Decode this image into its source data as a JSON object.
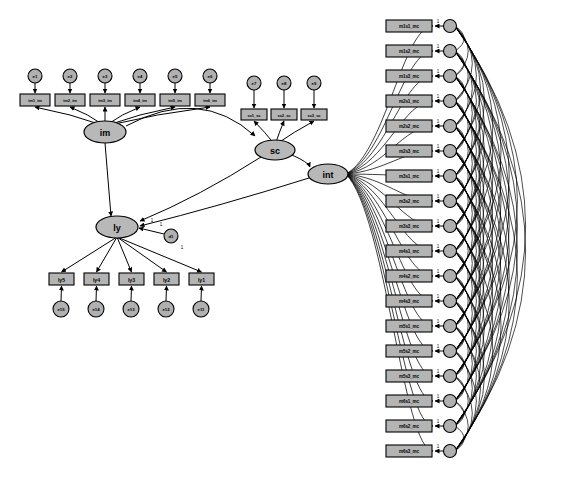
{
  "diagram": {
    "type": "sem-path-diagram",
    "width": 567,
    "height": 481,
    "background_color": "#ffffff",
    "node_fill_color": "#b4b4b4",
    "node_stroke_color": "#000000",
    "latent_variables": [
      {
        "id": "im",
        "label": "im",
        "cx": 105,
        "cy": 132,
        "rx": 21,
        "ry": 11
      },
      {
        "id": "ly",
        "label": "ly",
        "cx": 117,
        "cy": 227,
        "rx": 21,
        "ry": 11
      },
      {
        "id": "sc",
        "label": "sc",
        "cx": 275,
        "cy": 150,
        "rx": 20,
        "ry": 10
      },
      {
        "id": "int",
        "label": "int",
        "cx": 328,
        "cy": 174,
        "rx": 20,
        "ry": 10
      }
    ],
    "im_indicators": [
      {
        "id": "im1",
        "label": "im1_im",
        "x": 20,
        "y": 94,
        "w": 30,
        "h": 12
      },
      {
        "id": "im2",
        "label": "im2_im",
        "x": 55,
        "y": 94,
        "w": 30,
        "h": 12
      },
      {
        "id": "im3",
        "label": "im3_im",
        "x": 90,
        "y": 94,
        "w": 30,
        "h": 12
      },
      {
        "id": "im4",
        "label": "im4_im",
        "x": 125,
        "y": 94,
        "w": 30,
        "h": 12
      },
      {
        "id": "im5",
        "label": "im5_im",
        "x": 160,
        "y": 94,
        "w": 30,
        "h": 12
      },
      {
        "id": "im6",
        "label": "im6_im",
        "x": 195,
        "y": 94,
        "w": 30,
        "h": 12
      }
    ],
    "im_errors": [
      {
        "id": "e1",
        "label": "e1",
        "cx": 35,
        "cy": 76,
        "r": 7
      },
      {
        "id": "e2",
        "label": "e2",
        "cx": 70,
        "cy": 76,
        "r": 7
      },
      {
        "id": "e3",
        "label": "e3",
        "cx": 105,
        "cy": 76,
        "r": 7
      },
      {
        "id": "e4",
        "label": "e4",
        "cx": 140,
        "cy": 76,
        "r": 7
      },
      {
        "id": "e5",
        "label": "e5",
        "cx": 175,
        "cy": 76,
        "r": 7
      },
      {
        "id": "e6",
        "label": "e6",
        "cx": 210,
        "cy": 76,
        "r": 7
      }
    ],
    "sc_indicators": [
      {
        "id": "sc1",
        "label": "sc1_sc",
        "x": 241,
        "y": 109,
        "w": 26,
        "h": 11
      },
      {
        "id": "sc2",
        "label": "sc2_sc",
        "x": 271,
        "y": 109,
        "w": 26,
        "h": 11
      },
      {
        "id": "sc3",
        "label": "sc3_sc",
        "x": 301,
        "y": 109,
        "w": 26,
        "h": 11
      }
    ],
    "sc_errors": [
      {
        "id": "e7",
        "label": "e7",
        "cx": 254,
        "cy": 83,
        "r": 7
      },
      {
        "id": "e8",
        "label": "e8",
        "cx": 284,
        "cy": 83,
        "r": 7
      },
      {
        "id": "e9",
        "label": "e9",
        "cx": 314,
        "cy": 83,
        "r": 7
      }
    ],
    "ly_indicators": [
      {
        "id": "ly5",
        "label": "ly5",
        "x": 49,
        "y": 273,
        "w": 25,
        "h": 12
      },
      {
        "id": "ly4",
        "label": "ly4",
        "x": 84,
        "y": 273,
        "w": 25,
        "h": 12
      },
      {
        "id": "ly3",
        "label": "ly3",
        "x": 119,
        "y": 273,
        "w": 25,
        "h": 12
      },
      {
        "id": "ly2",
        "label": "ly2",
        "x": 154,
        "y": 273,
        "w": 25,
        "h": 12
      },
      {
        "id": "ly1",
        "label": "ly1",
        "x": 189,
        "y": 273,
        "w": 25,
        "h": 12
      }
    ],
    "ly_errors": [
      {
        "id": "e15",
        "label": "e15",
        "cx": 61,
        "cy": 309,
        "r": 8
      },
      {
        "id": "e14",
        "label": "e14",
        "cx": 96,
        "cy": 309,
        "r": 8
      },
      {
        "id": "e13",
        "label": "e13",
        "cx": 131,
        "cy": 309,
        "r": 8
      },
      {
        "id": "e12",
        "label": "e12",
        "cx": 166,
        "cy": 309,
        "r": 8
      },
      {
        "id": "e11",
        "label": "e11",
        "cx": 201,
        "cy": 309,
        "r": 8
      }
    ],
    "disturbances": [
      {
        "id": "d1",
        "label": "d1",
        "cx": 171,
        "cy": 236,
        "r": 7
      }
    ],
    "interaction_indicators": [
      {
        "id": "m1s1",
        "label": "m1s1_mc",
        "x": 386,
        "y": 20,
        "w": 46,
        "h": 12,
        "err_cx": 450,
        "err_cy": 26,
        "err_label": "r1"
      },
      {
        "id": "m1s2",
        "label": "m1s2_mc",
        "x": 386,
        "y": 45,
        "w": 46,
        "h": 12,
        "err_cx": 450,
        "err_cy": 51,
        "err_label": "r2"
      },
      {
        "id": "m1s3",
        "label": "m1s3_mc",
        "x": 386,
        "y": 70,
        "w": 46,
        "h": 12,
        "err_cx": 450,
        "err_cy": 76,
        "err_label": "r3"
      },
      {
        "id": "m2s1",
        "label": "m2s1_mc",
        "x": 386,
        "y": 95,
        "w": 46,
        "h": 12,
        "err_cx": 450,
        "err_cy": 101,
        "err_label": "r4"
      },
      {
        "id": "m2s2",
        "label": "m2s2_mc",
        "x": 386,
        "y": 120,
        "w": 46,
        "h": 12,
        "err_cx": 450,
        "err_cy": 126,
        "err_label": "r5"
      },
      {
        "id": "m2s3",
        "label": "m2s3_mc",
        "x": 386,
        "y": 145,
        "w": 46,
        "h": 12,
        "err_cx": 450,
        "err_cy": 151,
        "err_label": "r6"
      },
      {
        "id": "m3s1",
        "label": "m3s1_mc",
        "x": 386,
        "y": 170,
        "w": 46,
        "h": 12,
        "err_cx": 450,
        "err_cy": 176,
        "err_label": "r7"
      },
      {
        "id": "m3s2",
        "label": "m3s2_mc",
        "x": 386,
        "y": 195,
        "w": 46,
        "h": 12,
        "err_cx": 450,
        "err_cy": 201,
        "err_label": "r8"
      },
      {
        "id": "m3s3",
        "label": "m3s3_mc",
        "x": 386,
        "y": 220,
        "w": 46,
        "h": 12,
        "err_cx": 450,
        "err_cy": 226,
        "err_label": "r9"
      },
      {
        "id": "m4s1",
        "label": "m4s1_mc",
        "x": 386,
        "y": 245,
        "w": 46,
        "h": 12,
        "err_cx": 450,
        "err_cy": 251,
        "err_label": "r10"
      },
      {
        "id": "m4s2",
        "label": "m4s2_mc",
        "x": 386,
        "y": 270,
        "w": 46,
        "h": 12,
        "err_cx": 450,
        "err_cy": 276,
        "err_label": "r11"
      },
      {
        "id": "m4s3",
        "label": "m4s3_mc",
        "x": 386,
        "y": 295,
        "w": 46,
        "h": 12,
        "err_cx": 450,
        "err_cy": 301,
        "err_label": "r12"
      },
      {
        "id": "m5s1",
        "label": "m5s1_mc",
        "x": 386,
        "y": 320,
        "w": 46,
        "h": 12,
        "err_cx": 450,
        "err_cy": 326,
        "err_label": "r13"
      },
      {
        "id": "m5s2",
        "label": "m5s2_mc",
        "x": 386,
        "y": 345,
        "w": 46,
        "h": 12,
        "err_cx": 450,
        "err_cy": 351,
        "err_label": "r14"
      },
      {
        "id": "m5s3",
        "label": "m5s3_mc",
        "x": 386,
        "y": 370,
        "w": 46,
        "h": 12,
        "err_cx": 450,
        "err_cy": 376,
        "err_label": "r15"
      },
      {
        "id": "m6s1",
        "label": "m6s1_mc",
        "x": 386,
        "y": 395,
        "w": 46,
        "h": 12,
        "err_cx": 450,
        "err_cy": 401,
        "err_label": "r16"
      },
      {
        "id": "m6s2",
        "label": "m6s2_mc",
        "x": 386,
        "y": 420,
        "w": 46,
        "h": 12,
        "err_cx": 450,
        "err_cy": 426,
        "err_label": "r17"
      },
      {
        "id": "m6s3",
        "label": "m6s3_mc",
        "x": 386,
        "y": 445,
        "w": 46,
        "h": 12,
        "err_cx": 450,
        "err_cy": 451,
        "err_label": "r18"
      }
    ],
    "path_coefficients": [
      {
        "id": "c1",
        "label": "1",
        "x": 152,
        "y": 222
      },
      {
        "id": "c2",
        "label": "1",
        "x": 182,
        "y": 249
      },
      {
        "id": "c3",
        "label": "1",
        "x": 161,
        "y": 226
      }
    ],
    "structural_paths": [
      {
        "from": "im",
        "to": "ly"
      },
      {
        "from": "im",
        "to": "sc"
      },
      {
        "from": "sc",
        "to": "ly"
      },
      {
        "from": "int",
        "to": "ly"
      },
      {
        "from": "sc",
        "to": "int"
      }
    ]
  }
}
